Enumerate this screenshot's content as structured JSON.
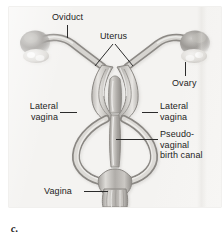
{
  "figure": {
    "caption": "c.",
    "panel_background": "#f4f3f1",
    "label_color": "#1d1d1d",
    "leader_color": "#2b2b2b"
  },
  "labels": [
    {
      "id": "oviduct",
      "text": "Oviduct",
      "side": "top"
    },
    {
      "id": "uterus",
      "text": "Uterus",
      "side": "top"
    },
    {
      "id": "ovary",
      "text": "Ovary",
      "side": "right"
    },
    {
      "id": "lateral-vagina-left",
      "text": "Lateral\nvagina",
      "side": "left"
    },
    {
      "id": "lateral-vagina-right",
      "text": "Lateral\nvagina",
      "side": "right"
    },
    {
      "id": "pseudo-vaginal",
      "text": "Pseudo-\nvaginal\nbirth canal",
      "side": "right"
    },
    {
      "id": "vagina",
      "text": "Vagina",
      "side": "left"
    }
  ],
  "structures": {
    "ovary_left": "ovary",
    "ovary_right": "ovary",
    "oviduct_left": "oviduct",
    "oviduct_right": "oviduct",
    "uterus_left": "uterine horn",
    "uterus_right": "uterine horn",
    "lateral_vagina_left": "lateral vagina",
    "lateral_vagina_right": "lateral vagina",
    "pseudo_vaginal_birth_canal": "pseudo-vaginal birth canal",
    "vagina": "vagina"
  }
}
